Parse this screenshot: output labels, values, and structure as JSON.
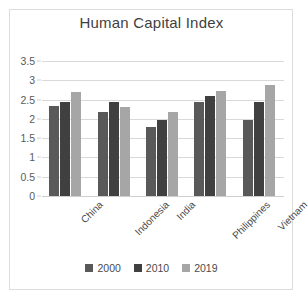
{
  "chart_data": {
    "type": "bar",
    "title": "Human Capital Index",
    "xlabel": "",
    "ylabel": "",
    "ylim": [
      0,
      3.5
    ],
    "yticks": [
      "0",
      "0.5",
      "1",
      "1.5",
      "2",
      "2.5",
      "3",
      "3.5"
    ],
    "ytick_values": [
      0,
      0.5,
      1,
      1.5,
      2,
      2.5,
      3,
      3.5
    ],
    "grid": true,
    "legend_position": "bottom",
    "categories": [
      "China",
      "Indonesia",
      "India",
      "Philippines",
      "Vietnam"
    ],
    "series": [
      {
        "name": "2000",
        "color": "#595959",
        "values": [
          2.33,
          2.18,
          1.78,
          2.45,
          1.97
        ]
      },
      {
        "name": "2010",
        "color": "#404040",
        "values": [
          2.45,
          2.43,
          1.97,
          2.6,
          2.43
        ]
      },
      {
        "name": "2019",
        "color": "#a6a6a6",
        "values": [
          2.7,
          2.3,
          2.17,
          2.72,
          2.87
        ]
      }
    ]
  },
  "style": {
    "gridline_color": "#d9d9d9",
    "tick_text_color": "#5a5a5a",
    "title_color": "#3f3f3f",
    "border_color": "#dcdcdc",
    "background": "#ffffff"
  }
}
